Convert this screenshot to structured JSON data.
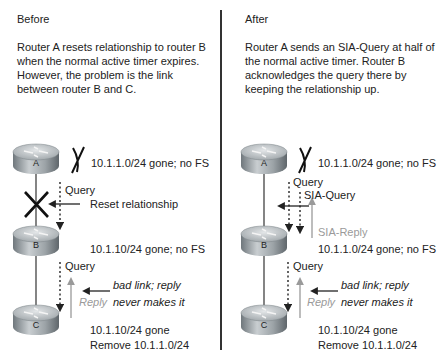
{
  "before": {
    "title": "Before",
    "description": "Router A resets relationship to router B when the normal active timer expires.  However, the problem is the link between router B and C.",
    "routers": [
      {
        "label": "A",
        "note": "10.1.1.0/24 gone; no FS"
      },
      {
        "label": "B",
        "note": "10.1.10/24 gone; no FS"
      },
      {
        "label": "C",
        "note_line1": "10.1.10/24 gone",
        "note_line2": "Remove 10.1.1.0/24"
      }
    ],
    "query_ab": "Query",
    "reset_label": "Reset relationship",
    "query_bc": "Query",
    "reply_label": "Reply",
    "bad_link_line1": "bad link; reply",
    "bad_link_line2": "never makes it"
  },
  "after": {
    "title": "After",
    "description": "Router A sends an SIA-Query at half of the normal active timer.  Router B acknowledges the query there by keeping the relationship up.",
    "routers": [
      {
        "label": "A",
        "note": "10.1.1.0/24 gone; no FS"
      },
      {
        "label": "B",
        "note": "10.1.1.0/24 gone; no FS"
      },
      {
        "label": "C",
        "note_line1": "10.1.10/24 gone",
        "note_line2": "Remove 10.1.1.0/24"
      }
    ],
    "query_ab": "Query",
    "sia_query": "SIA-Query",
    "sia_reply": "SIA-Reply",
    "query_bc": "Query",
    "reply_label": "Reply",
    "bad_link_line1": "bad link; reply",
    "bad_link_line2": "never makes it"
  },
  "colors": {
    "router_top": "#c8cdd0",
    "router_side": "#8d9499",
    "line": "#333333",
    "reply_gray": "#9a9a9a"
  }
}
